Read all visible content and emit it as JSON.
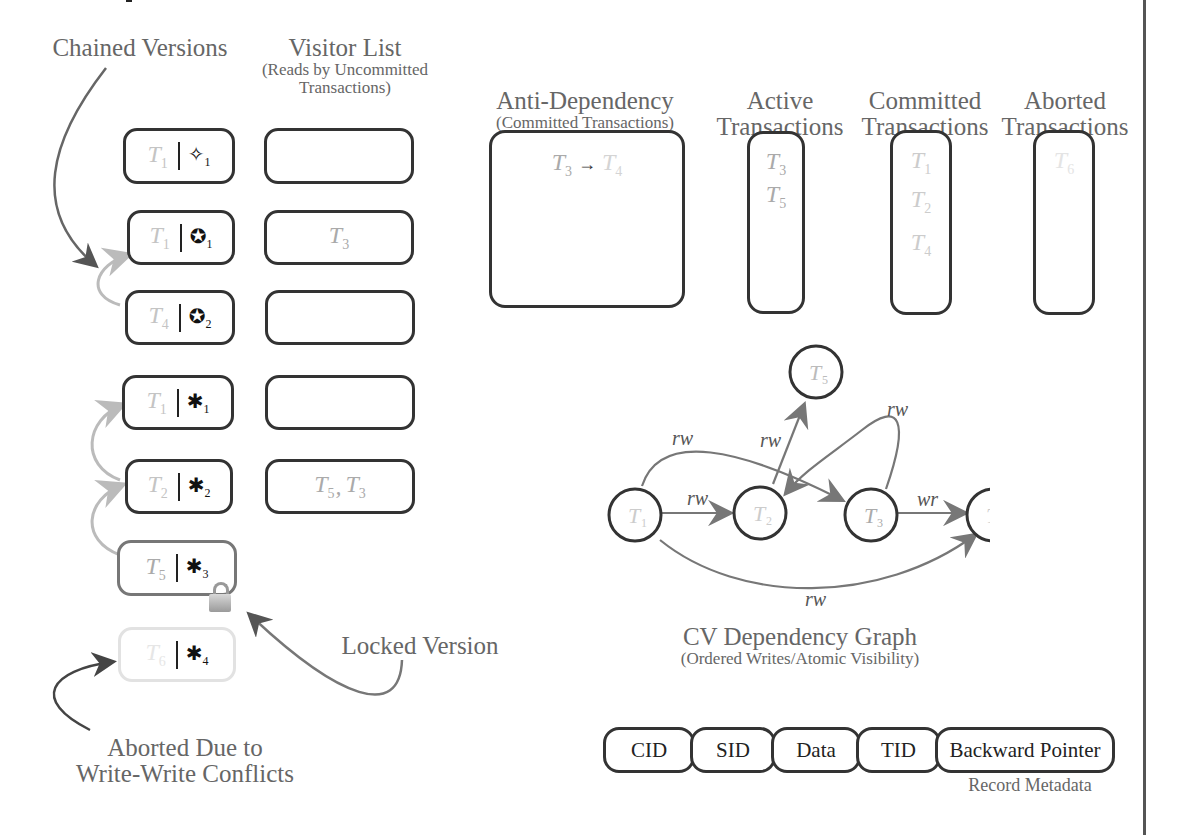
{
  "headers": {
    "chained_versions": "Chained Versions",
    "visitor_list": "Visitor List",
    "visitor_list_sub1": "(Reads by Uncommitted",
    "visitor_list_sub2": "Transactions)",
    "anti_dependency": "Anti-Dependency",
    "anti_dependency_sub": "(Committed Transactions)",
    "active_1": "Active",
    "active_2": "Transactions",
    "committed_1": "Committed",
    "committed_2": "Transactions",
    "aborted_1": "Aborted",
    "aborted_2": "Transactions"
  },
  "versions": [
    {
      "txn": "T",
      "txn_sub": "1",
      "symbol": "✧",
      "symbol_sub": "1",
      "visitors": ""
    },
    {
      "txn": "T",
      "txn_sub": "1",
      "symbol": "✪",
      "symbol_sub": "1",
      "visitors": "T3"
    },
    {
      "txn": "T",
      "txn_sub": "4",
      "symbol": "✪",
      "symbol_sub": "2",
      "visitors": ""
    },
    {
      "txn": "T",
      "txn_sub": "1",
      "symbol": "✱",
      "symbol_sub": "1",
      "visitors": ""
    },
    {
      "txn": "T",
      "txn_sub": "2",
      "symbol": "✱",
      "symbol_sub": "2",
      "visitors": "T5, T3"
    },
    {
      "txn": "T",
      "txn_sub": "5",
      "symbol": "✱",
      "symbol_sub": "3",
      "locked": true
    },
    {
      "txn": "T",
      "txn_sub": "6",
      "symbol": "✱",
      "symbol_sub": "4",
      "aborted": true
    }
  ],
  "visitor_entries": {
    "row2": {
      "t": "T",
      "s": "3"
    },
    "row5": [
      {
        "t": "T",
        "s": "5"
      },
      {
        "t": "T",
        "s": "3"
      }
    ]
  },
  "anti_dependency_entry": {
    "from": "T",
    "from_sub": "3",
    "arrow": "→",
    "to": "T",
    "to_sub": "4"
  },
  "active_transactions": [
    {
      "t": "T",
      "s": "3"
    },
    {
      "t": "T",
      "s": "5"
    }
  ],
  "committed_transactions": [
    {
      "t": "T",
      "s": "1"
    },
    {
      "t": "T",
      "s": "2"
    },
    {
      "t": "T",
      "s": "4"
    }
  ],
  "aborted_transactions": [
    {
      "t": "T",
      "s": "6"
    }
  ],
  "annotations": {
    "locked_version": "Locked Version",
    "aborted_1": "Aborted Due to",
    "aborted_2": "Write-Write Conflicts",
    "lock_icon": "lock-icon"
  },
  "graph": {
    "title": "CV Dependency Graph",
    "subtitle": "(Ordered Writes/Atomic Visibility)",
    "nodes": [
      {
        "id": "T1",
        "label": "T",
        "sub": "1"
      },
      {
        "id": "T2",
        "label": "T",
        "sub": "2"
      },
      {
        "id": "T3",
        "label": "T",
        "sub": "3"
      },
      {
        "id": "T4",
        "label": "T",
        "sub": "4"
      },
      {
        "id": "T5",
        "label": "T",
        "sub": "5"
      }
    ],
    "edges": [
      {
        "from": "T1",
        "to": "T2",
        "label": "rw"
      },
      {
        "from": "T1",
        "to": "T3",
        "label": "rw"
      },
      {
        "from": "T1",
        "to": "T4",
        "label": "rw"
      },
      {
        "from": "T2",
        "to": "T5",
        "label": "rw"
      },
      {
        "from": "T3",
        "to": "T2",
        "label": "rw"
      },
      {
        "from": "T3",
        "to": "T4",
        "label": "wr"
      }
    ]
  },
  "record_metadata": {
    "fields": [
      "CID",
      "SID",
      "Data",
      "TID",
      "Backward Pointer"
    ],
    "caption": "Record Metadata"
  }
}
